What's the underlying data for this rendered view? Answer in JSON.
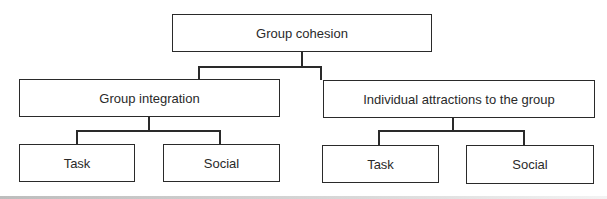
{
  "diagram": {
    "type": "hierarchy",
    "root": {
      "label": "Group cohesion",
      "children": [
        {
          "label": "Group integration",
          "children": [
            {
              "label": "Task"
            },
            {
              "label": "Social"
            }
          ]
        },
        {
          "label": "Individual attractions to the group",
          "children": [
            {
              "label": "Task"
            },
            {
              "label": "Social"
            }
          ]
        }
      ]
    }
  }
}
